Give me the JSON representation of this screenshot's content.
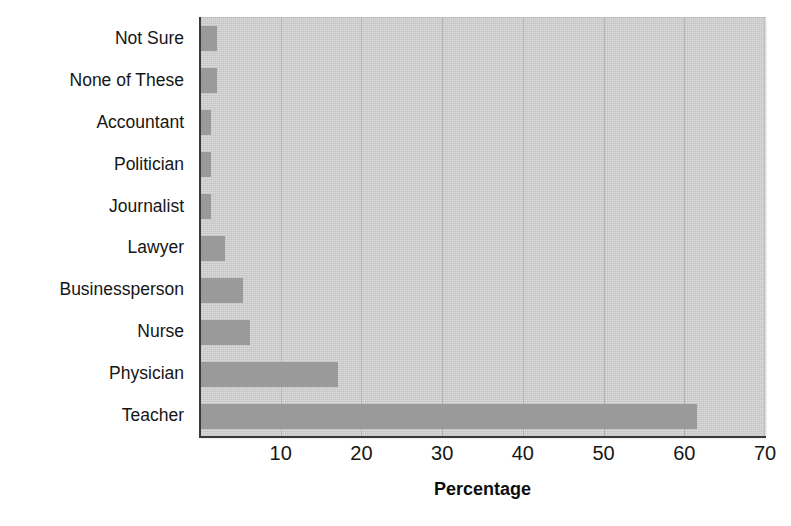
{
  "chart_data": {
    "type": "bar",
    "orientation": "horizontal",
    "title": "",
    "xlabel": "Percentage",
    "ylabel": "",
    "xlim": [
      0,
      70
    ],
    "xticks": [
      10,
      20,
      30,
      40,
      50,
      60,
      70
    ],
    "grid": true,
    "legend": null,
    "categories": [
      "Not Sure",
      "None of These",
      "Accountant",
      "Politician",
      "Journalist",
      "Lawyer",
      "Businessperson",
      "Nurse",
      "Physician",
      "Teacher"
    ],
    "values": [
      2.1,
      2.1,
      1.4,
      1.4,
      1.4,
      3.1,
      5.3,
      6.2,
      17.1,
      61.6
    ],
    "colors": {
      "bar": "#9a9a9a",
      "plot_background": "#cfcfcf",
      "gridline": "#b4b4b4",
      "axis": "#3a3a3a",
      "text": "#161616",
      "page_background": "#ffffff"
    }
  },
  "axis": {
    "x_title": "Percentage",
    "tick_labels": [
      "10",
      "20",
      "30",
      "40",
      "50",
      "60",
      "70"
    ]
  },
  "categories": [
    {
      "label": "Not Sure"
    },
    {
      "label": "None of These"
    },
    {
      "label": "Accountant"
    },
    {
      "label": "Politician"
    },
    {
      "label": "Journalist"
    },
    {
      "label": "Lawyer"
    },
    {
      "label": "Businessperson"
    },
    {
      "label": "Nurse"
    },
    {
      "label": "Physician"
    },
    {
      "label": "Teacher"
    }
  ]
}
